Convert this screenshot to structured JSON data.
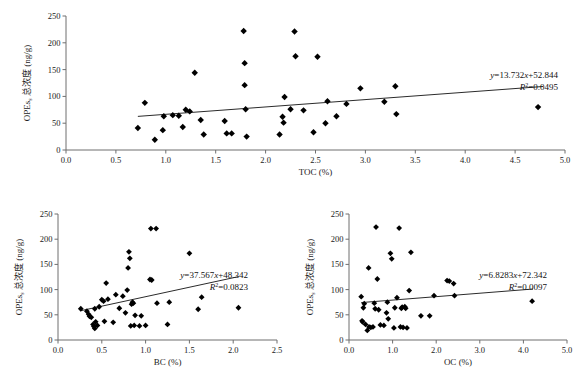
{
  "figure": {
    "type": "scatter-matrix",
    "panel_count": 3,
    "marker": "filled-diamond",
    "marker_color": "#000000",
    "axis_color": "#6f6f6f",
    "fitline_color": "#2b2b2b"
  },
  "chart_data": [
    {
      "id": "toc",
      "type": "scatter",
      "title": "",
      "xlabel": "TOC (%)",
      "ylabel_main": "OPEs",
      "ylabel_sub": "s",
      "ylabel_rest": " 总浓度 (ng/g)",
      "ylabel": "OPEs 总浓度 (ng/g)",
      "xlim": [
        0.0,
        5.0
      ],
      "ylim": [
        0,
        250
      ],
      "xticks": [
        "0.0",
        "0.5",
        "1.0",
        "1.5",
        "2.0",
        "2.5",
        "3.0",
        "3.5",
        "4.0",
        "4.5",
        "5.0"
      ],
      "yticks": [
        "0",
        "50",
        "100",
        "150",
        "200",
        "250"
      ],
      "grid": false,
      "legend": "none",
      "equation": "y=13.732x+52.844",
      "equation_slope": 13.732,
      "equation_intercept": 52.844,
      "r2_label": "R",
      "r2_exp": "2",
      "r2_value": "=0.0495",
      "r_squared": 0.0495,
      "fitline_x_range": [
        0.72,
        4.78
      ],
      "points": [
        [
          0.72,
          41
        ],
        [
          0.79,
          88
        ],
        [
          0.89,
          19
        ],
        [
          0.97,
          37
        ],
        [
          0.98,
          63
        ],
        [
          1.07,
          65
        ],
        [
          1.13,
          64
        ],
        [
          1.17,
          43
        ],
        [
          1.2,
          75
        ],
        [
          1.24,
          72
        ],
        [
          1.29,
          144
        ],
        [
          1.35,
          56
        ],
        [
          1.38,
          29
        ],
        [
          1.59,
          54
        ],
        [
          1.61,
          31
        ],
        [
          1.66,
          31
        ],
        [
          1.78,
          222
        ],
        [
          1.79,
          162
        ],
        [
          1.79,
          121
        ],
        [
          1.8,
          76
        ],
        [
          1.81,
          25
        ],
        [
          2.14,
          29
        ],
        [
          2.17,
          62
        ],
        [
          2.18,
          51
        ],
        [
          2.19,
          99
        ],
        [
          2.25,
          76
        ],
        [
          2.29,
          221
        ],
        [
          2.3,
          175
        ],
        [
          2.38,
          74
        ],
        [
          2.48,
          33
        ],
        [
          2.52,
          174
        ],
        [
          2.6,
          50
        ],
        [
          2.62,
          91
        ],
        [
          2.71,
          63
        ],
        [
          2.81,
          86
        ],
        [
          2.95,
          115
        ],
        [
          3.19,
          90
        ],
        [
          3.3,
          119
        ],
        [
          3.31,
          67
        ],
        [
          4.73,
          80
        ]
      ]
    },
    {
      "id": "bc",
      "type": "scatter",
      "title": "",
      "xlabel": "BC (%)",
      "ylabel_main": "OPEs",
      "ylabel_sub": "s",
      "ylabel_rest": " 总浓度 (ng/g)",
      "ylabel": "OPEs 总浓度 (ng/g)",
      "xlim": [
        0.0,
        2.5
      ],
      "ylim": [
        0,
        250
      ],
      "xticks": [
        "0.0",
        "0.5",
        "1.0",
        "1.5",
        "2.0",
        "2.5"
      ],
      "yticks": [
        "0",
        "50",
        "100",
        "150",
        "200",
        "250"
      ],
      "grid": false,
      "legend": "none",
      "equation": "y=37.567x+48.342",
      "equation_slope": 37.567,
      "equation_intercept": 48.342,
      "r2_label": "R",
      "r2_exp": "2",
      "r2_value": "=0.0823",
      "r_squared": 0.0823,
      "fitline_x_range": [
        0.26,
        2.06
      ],
      "points": [
        [
          0.26,
          62
        ],
        [
          0.33,
          57
        ],
        [
          0.35,
          51
        ],
        [
          0.36,
          47
        ],
        [
          0.38,
          45
        ],
        [
          0.4,
          31
        ],
        [
          0.41,
          27
        ],
        [
          0.42,
          23
        ],
        [
          0.42,
          62
        ],
        [
          0.43,
          36
        ],
        [
          0.45,
          29
        ],
        [
          0.47,
          66
        ],
        [
          0.5,
          80
        ],
        [
          0.52,
          77
        ],
        [
          0.53,
          37
        ],
        [
          0.55,
          113
        ],
        [
          0.57,
          81
        ],
        [
          0.63,
          35
        ],
        [
          0.66,
          90
        ],
        [
          0.7,
          63
        ],
        [
          0.74,
          87
        ],
        [
          0.77,
          54
        ],
        [
          0.79,
          99
        ],
        [
          0.8,
          143
        ],
        [
          0.81,
          175
        ],
        [
          0.82,
          162
        ],
        [
          0.83,
          28
        ],
        [
          0.84,
          71
        ],
        [
          0.85,
          75
        ],
        [
          0.86,
          73
        ],
        [
          0.87,
          29
        ],
        [
          0.88,
          49
        ],
        [
          0.93,
          28
        ],
        [
          0.95,
          48
        ],
        [
          1.0,
          29
        ],
        [
          1.05,
          120
        ],
        [
          1.06,
          221
        ],
        [
          1.07,
          119
        ],
        [
          1.12,
          221
        ],
        [
          1.13,
          73
        ],
        [
          1.25,
          31
        ],
        [
          1.27,
          75
        ],
        [
          1.5,
          172
        ],
        [
          1.6,
          61
        ],
        [
          1.64,
          85
        ],
        [
          2.06,
          64
        ]
      ]
    },
    {
      "id": "oc",
      "type": "scatter",
      "title": "",
      "xlabel": "OC (%)",
      "ylabel_main": "OPEs",
      "ylabel_sub": "s",
      "ylabel_rest": " 总浓度 (ng/g)",
      "ylabel": "OPEs 总浓度 (ng/g)",
      "xlim": [
        0.0,
        5.0
      ],
      "ylim": [
        0,
        250
      ],
      "xticks": [
        "0.0",
        "1.0",
        "2.0",
        "3.0",
        "4.0",
        "5.0"
      ],
      "yticks": [
        "0",
        "50",
        "100",
        "150",
        "200",
        "250"
      ],
      "grid": false,
      "legend": "none",
      "equation": "y=6.8283x+72.342",
      "equation_slope": 6.8283,
      "equation_intercept": 72.342,
      "r2_label": "R",
      "r2_exp": "2",
      "r2_value": "=0.0097",
      "r_squared": 0.0097,
      "fitline_x_range": [
        0.28,
        4.22
      ],
      "points": [
        [
          0.28,
          86
        ],
        [
          0.3,
          38
        ],
        [
          0.31,
          36
        ],
        [
          0.33,
          64
        ],
        [
          0.35,
          72
        ],
        [
          0.38,
          31
        ],
        [
          0.42,
          19
        ],
        [
          0.45,
          143
        ],
        [
          0.46,
          26
        ],
        [
          0.5,
          25
        ],
        [
          0.55,
          26
        ],
        [
          0.58,
          73
        ],
        [
          0.6,
          62
        ],
        [
          0.62,
          224
        ],
        [
          0.65,
          121
        ],
        [
          0.68,
          60
        ],
        [
          0.72,
          30
        ],
        [
          0.8,
          29
        ],
        [
          0.86,
          54
        ],
        [
          0.88,
          75
        ],
        [
          0.9,
          42
        ],
        [
          0.95,
          172
        ],
        [
          0.98,
          161
        ],
        [
          1.03,
          24
        ],
        [
          1.05,
          64
        ],
        [
          1.1,
          84
        ],
        [
          1.15,
          222
        ],
        [
          1.18,
          26
        ],
        [
          1.2,
          63
        ],
        [
          1.22,
          65
        ],
        [
          1.24,
          25
        ],
        [
          1.28,
          66
        ],
        [
          1.3,
          63
        ],
        [
          1.33,
          24
        ],
        [
          1.38,
          98
        ],
        [
          1.42,
          174
        ],
        [
          1.65,
          48
        ],
        [
          1.85,
          48
        ],
        [
          1.95,
          88
        ],
        [
          2.25,
          118
        ],
        [
          2.3,
          117
        ],
        [
          2.4,
          112
        ],
        [
          2.42,
          88
        ],
        [
          4.2,
          77
        ]
      ]
    }
  ]
}
